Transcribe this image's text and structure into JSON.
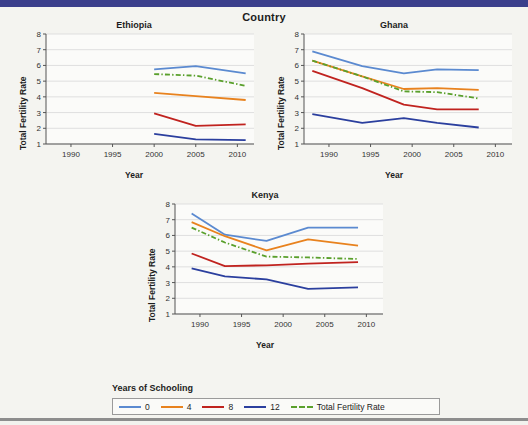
{
  "page": {
    "title": "Country",
    "accent_bar_color": "#3b3f8c",
    "bottom_rule_color": "#8d8d8d",
    "background": "#f4f4f0"
  },
  "legend": {
    "title": "Years of Schooling",
    "items": [
      {
        "label": "0",
        "color": "#5b8ad0",
        "style": "solid"
      },
      {
        "label": "4",
        "color": "#e8821e",
        "style": "solid"
      },
      {
        "label": "8",
        "color": "#c0231f",
        "style": "solid"
      },
      {
        "label": "12",
        "color": "#2b3f9e",
        "style": "solid"
      },
      {
        "label": "Total Fertility Rate",
        "color": "#5aa02c",
        "style": "dashed"
      }
    ]
  },
  "chart_data": [
    {
      "type": "line",
      "title": "Ethiopia",
      "xlabel": "Year",
      "ylabel": "Total Fertility Rate",
      "xlim": [
        1987,
        2012
      ],
      "ylim": [
        1,
        8
      ],
      "xticks": [
        1990,
        1995,
        2000,
        2005,
        2010
      ],
      "yticks": [
        1,
        2,
        3,
        4,
        5,
        6,
        7,
        8
      ],
      "grid": true,
      "legend_position": "bottom",
      "series": [
        {
          "name": "0",
          "color": "#5b8ad0",
          "style": "solid",
          "x": [
            2000,
            2005,
            2011
          ],
          "values": [
            5.75,
            5.95,
            5.5
          ]
        },
        {
          "name": "4",
          "color": "#e8821e",
          "style": "solid",
          "x": [
            2000,
            2005,
            2011
          ],
          "values": [
            4.25,
            4.05,
            3.8
          ]
        },
        {
          "name": "8",
          "color": "#c0231f",
          "style": "solid",
          "x": [
            2000,
            2005,
            2011
          ],
          "values": [
            2.95,
            2.15,
            2.25
          ]
        },
        {
          "name": "12",
          "color": "#2b3f9e",
          "style": "solid",
          "x": [
            2000,
            2005,
            2011
          ],
          "values": [
            1.65,
            1.3,
            1.25
          ]
        },
        {
          "name": "Total Fertility Rate",
          "color": "#5aa02c",
          "style": "dashed",
          "x": [
            2000,
            2005,
            2011
          ],
          "values": [
            5.45,
            5.35,
            4.7
          ]
        }
      ]
    },
    {
      "type": "line",
      "title": "Ghana",
      "xlabel": "Year",
      "ylabel": "Total Fertility Rate",
      "xlim": [
        1987,
        2012
      ],
      "ylim": [
        1,
        8
      ],
      "xticks": [
        1990,
        1995,
        2000,
        2005,
        2010
      ],
      "yticks": [
        1,
        2,
        3,
        4,
        5,
        6,
        7,
        8
      ],
      "grid": true,
      "legend_position": "bottom",
      "series": [
        {
          "name": "0",
          "color": "#5b8ad0",
          "style": "solid",
          "x": [
            1988,
            1994,
            1999,
            2003,
            2008
          ],
          "values": [
            6.9,
            5.95,
            5.5,
            5.75,
            5.7
          ]
        },
        {
          "name": "4",
          "color": "#e8821e",
          "style": "solid",
          "x": [
            1988,
            1994,
            1999,
            2003,
            2008
          ],
          "values": [
            6.3,
            5.3,
            4.5,
            4.55,
            4.45
          ]
        },
        {
          "name": "8",
          "color": "#c0231f",
          "style": "solid",
          "x": [
            1988,
            1994,
            1999,
            2003,
            2008
          ],
          "values": [
            5.65,
            4.55,
            3.5,
            3.2,
            3.2
          ]
        },
        {
          "name": "12",
          "color": "#2b3f9e",
          "style": "solid",
          "x": [
            1988,
            1994,
            1999,
            2003,
            2008
          ],
          "values": [
            2.9,
            2.35,
            2.65,
            2.35,
            2.05
          ]
        },
        {
          "name": "Total Fertility Rate",
          "color": "#5aa02c",
          "style": "dashed",
          "x": [
            1988,
            1994,
            1999,
            2003,
            2008
          ],
          "values": [
            6.3,
            5.3,
            4.35,
            4.3,
            3.9
          ]
        }
      ]
    },
    {
      "type": "line",
      "title": "Kenya",
      "xlabel": "Year",
      "ylabel": "Total Fertility Rate",
      "xlim": [
        1987,
        2012
      ],
      "ylim": [
        1,
        8
      ],
      "xticks": [
        1990,
        1995,
        2000,
        2005,
        2010
      ],
      "yticks": [
        1,
        2,
        3,
        4,
        5,
        6,
        7,
        8
      ],
      "grid": true,
      "legend_position": "bottom",
      "series": [
        {
          "name": "0",
          "color": "#5b8ad0",
          "style": "solid",
          "x": [
            1989,
            1993,
            1998,
            2003,
            2009
          ],
          "values": [
            7.4,
            6.05,
            5.65,
            6.5,
            6.5
          ]
        },
        {
          "name": "4",
          "color": "#e8821e",
          "style": "solid",
          "x": [
            1989,
            1993,
            1998,
            2003,
            2009
          ],
          "values": [
            6.85,
            5.95,
            5.05,
            5.75,
            5.35
          ]
        },
        {
          "name": "8",
          "color": "#c0231f",
          "style": "solid",
          "x": [
            1989,
            1993,
            1998,
            2003,
            2009
          ],
          "values": [
            4.85,
            4.05,
            4.1,
            4.2,
            4.3
          ]
        },
        {
          "name": "12",
          "color": "#2b3f9e",
          "style": "solid",
          "x": [
            1989,
            1993,
            1998,
            2003,
            2009
          ],
          "values": [
            3.9,
            3.4,
            3.2,
            2.6,
            2.7
          ]
        },
        {
          "name": "Total Fertility Rate",
          "color": "#5aa02c",
          "style": "dashed",
          "x": [
            1989,
            1993,
            1998,
            2003,
            2009
          ],
          "values": [
            6.5,
            5.55,
            4.65,
            4.6,
            4.5
          ]
        }
      ]
    }
  ]
}
